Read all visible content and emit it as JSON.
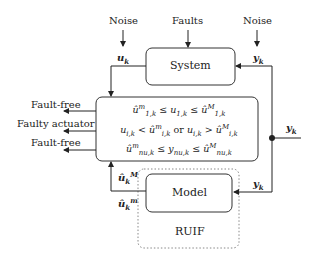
{
  "diagram": {
    "type": "block-diagram",
    "blocks": {
      "system": {
        "label": "System"
      },
      "model": {
        "label": "Model"
      },
      "ruif": {
        "label": "RUIF",
        "style": "dashed-rounded"
      },
      "decision": {
        "lines": [
          "û^m_{1,k} ≤ u_{1,k} ≤ û^M_{1,k}",
          "u_{i,k} < û^m_{i,k} or u_{i,k} > û^M_{i,k}",
          "û^m_{n_u,k} ≤ y_{n_u,k} ≤ û^M_{n_u,k}"
        ]
      }
    },
    "inputs": {
      "noise_left": "Noise",
      "faults": "Faults",
      "noise_right": "Noise"
    },
    "signals": {
      "u_k": "u",
      "y_k_system": "y",
      "y_k_out": "y",
      "y_k_model": "y",
      "u_hat_M": "û",
      "u_hat_m": "û",
      "sub_k": "k",
      "sup_M": "M",
      "sup_m": "m"
    },
    "outputs": [
      {
        "label": "Fault-free"
      },
      {
        "label": "Faulty actuator"
      },
      {
        "label": "Fault-free"
      }
    ],
    "ineq": {
      "l1": {
        "u": "û",
        "sup_m": "m",
        "sub1": "1,k",
        "mid": "u",
        "leq": "≤",
        "sup_M": "M"
      },
      "l2": {
        "or": "or",
        "lt": "<",
        "gt": ">",
        "sub_i": "i,k"
      },
      "l3": {
        "sub_n": "n",
        "sub_u": "u",
        "comma_k": ",k",
        "y": "y"
      }
    }
  }
}
